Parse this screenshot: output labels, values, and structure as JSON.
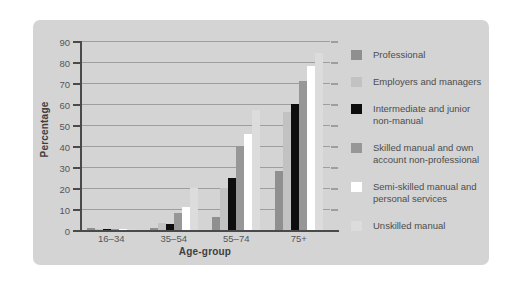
{
  "chart_data": {
    "type": "bar",
    "title": "",
    "xlabel": "Age-group",
    "ylabel": "Percentage",
    "categories": [
      "16–34",
      "35–54",
      "55–74",
      "75+"
    ],
    "series": [
      {
        "name": "Professional",
        "color": "#8f8f8f",
        "values": [
          1,
          1,
          6,
          28
        ]
      },
      {
        "name": "Employers and managers",
        "color": "#c2c2c2",
        "values": [
          0.5,
          3.5,
          20,
          56
        ]
      },
      {
        "name": "Intermediate and junior non-manual",
        "color": "#0d0d0d",
        "values": [
          0.5,
          3,
          25,
          60
        ]
      },
      {
        "name": "Skilled manual and own account non-professional",
        "color": "#979797",
        "values": [
          0.5,
          8,
          40,
          71
        ]
      },
      {
        "name": "Semi-skilled manual and personal services",
        "color": "#ffffff",
        "values": [
          0.3,
          11,
          45.5,
          78
        ]
      },
      {
        "name": "Unskilled manual",
        "color": "#dcdcdc",
        "values": [
          0.3,
          20,
          57,
          84.5
        ]
      }
    ],
    "ylim": [
      0,
      90
    ],
    "ytick_step": 10,
    "yticks": [
      0,
      10,
      20,
      30,
      40,
      50,
      60,
      70,
      80,
      90
    ],
    "grid": true,
    "legend_position": "right"
  },
  "colors": {
    "panel_background": "#d4d4d4",
    "page_background": "#ffffff",
    "gridline": "#9e9e9e",
    "axis": "#4a4a4a",
    "tick_text": "#565656",
    "legend_text": "#4d4d4d"
  }
}
